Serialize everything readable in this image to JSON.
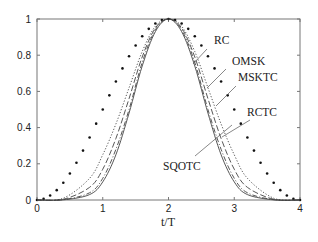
{
  "chart_data": {
    "type": "line",
    "title": "",
    "xlabel": "t/T",
    "ylabel": "",
    "xlim": [
      0,
      4
    ],
    "ylim": [
      0,
      1
    ],
    "grid": false,
    "legend_position": "inline labels with leader lines (right side)",
    "xticks": [
      0,
      1,
      2,
      3,
      4
    ],
    "xtick_labels": [
      "0",
      "1",
      "2",
      "3",
      "4"
    ],
    "yticks": [
      0,
      0.2,
      0.4,
      0.6,
      0.8,
      1
    ],
    "ytick_labels": [
      "0",
      "0.2",
      "0.4",
      "0.6",
      "0.8",
      "1"
    ],
    "series": [
      {
        "name": "RC",
        "style": "dots",
        "x": [
          0,
          0.2,
          0.4,
          0.6,
          0.8,
          1.0,
          1.2,
          1.4,
          1.6,
          1.8,
          2.0,
          2.2,
          2.4,
          2.6,
          2.8,
          3.0,
          3.2,
          3.4,
          3.6,
          3.8,
          4.0
        ],
        "values": [
          0,
          0.024,
          0.095,
          0.206,
          0.345,
          0.5,
          0.655,
          0.794,
          0.905,
          0.976,
          1,
          0.976,
          0.905,
          0.794,
          0.655,
          0.5,
          0.345,
          0.206,
          0.095,
          0.024,
          0
        ]
      },
      {
        "name": "OMSK",
        "style": "dotted",
        "x": [
          0,
          0.4,
          0.8,
          1.0,
          1.2,
          1.4,
          1.6,
          1.8,
          2.0,
          2.2,
          2.4,
          2.6,
          2.8,
          3.0,
          3.2,
          3.6,
          4.0
        ],
        "values": [
          0,
          0.01,
          0.12,
          0.25,
          0.42,
          0.62,
          0.82,
          0.96,
          1,
          0.96,
          0.82,
          0.62,
          0.42,
          0.25,
          0.12,
          0.01,
          0
        ]
      },
      {
        "name": "MSKTC",
        "style": "dashed",
        "x": [
          0,
          0.4,
          0.8,
          1.0,
          1.2,
          1.4,
          1.6,
          1.8,
          2.0,
          2.2,
          2.4,
          2.6,
          2.8,
          3.0,
          3.2,
          3.6,
          4.0
        ],
        "values": [
          0,
          0.004,
          0.07,
          0.17,
          0.34,
          0.56,
          0.79,
          0.95,
          1,
          0.95,
          0.79,
          0.56,
          0.34,
          0.17,
          0.07,
          0.004,
          0
        ]
      },
      {
        "name": "RCTC",
        "style": "dash-dot",
        "x": [
          0,
          0.4,
          0.8,
          1.0,
          1.2,
          1.4,
          1.6,
          1.8,
          2.0,
          2.2,
          2.4,
          2.6,
          2.8,
          3.0,
          3.2,
          3.6,
          4.0
        ],
        "values": [
          0,
          0.002,
          0.04,
          0.12,
          0.28,
          0.5,
          0.76,
          0.94,
          1,
          0.94,
          0.76,
          0.5,
          0.28,
          0.12,
          0.04,
          0.002,
          0
        ]
      },
      {
        "name": "SQOTC",
        "style": "solid",
        "x": [
          0,
          0.4,
          0.8,
          1.0,
          1.2,
          1.4,
          1.6,
          1.8,
          2.0,
          2.2,
          2.4,
          2.6,
          2.8,
          3.0,
          3.2,
          3.6,
          4.0
        ],
        "values": [
          0,
          0.001,
          0.03,
          0.1,
          0.25,
          0.48,
          0.74,
          0.93,
          1,
          0.93,
          0.74,
          0.48,
          0.25,
          0.1,
          0.03,
          0.001,
          0
        ]
      }
    ],
    "annotations": [
      {
        "text": "RC",
        "label_pos": [
          3.0,
          0.91
        ]
      },
      {
        "text": "OMSK",
        "label_pos": [
          3.0,
          0.75
        ]
      },
      {
        "text": "MSKTC",
        "label_pos": [
          3.0,
          0.61
        ]
      },
      {
        "text": "RCTC",
        "label_pos": [
          3.0,
          0.42
        ]
      },
      {
        "text": "SQOTC",
        "label_pos": [
          1.3,
          0.25
        ]
      }
    ]
  }
}
